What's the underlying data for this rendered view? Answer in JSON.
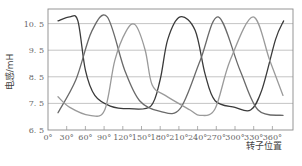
{
  "chart_data": {
    "type": "line",
    "title": "",
    "xlabel": "转子位置",
    "ylabel": "电感/mH",
    "xlim": [
      0,
      360
    ],
    "ylim": [
      6.5,
      10.9
    ],
    "x_ticks": [
      "0°",
      "30°",
      "60°",
      "90°",
      "120°",
      "150°",
      "180°",
      "210°",
      "240°",
      "270°",
      "300°",
      "330°",
      "360°"
    ],
    "y_ticks": [
      "10.5",
      "9.5",
      "8.5",
      "7.5",
      "6.5"
    ],
    "y_tick_values": [
      10.5,
      9.5,
      8.5,
      7.5,
      6.5
    ],
    "grid": "horizontal",
    "legend": "none",
    "series": [
      {
        "name": "phase-1",
        "color": "#3a3a3a",
        "x": [
          16,
          35,
          48,
          60,
          75,
          100,
          130,
          165,
          180,
          192,
          212,
          236,
          252,
          268,
          300,
          325,
          343,
          365,
          378
        ],
        "y": [
          10.6,
          10.75,
          10.6,
          8.75,
          7.8,
          7.4,
          7.3,
          7.4,
          8.4,
          9.9,
          10.75,
          10.25,
          8.6,
          7.6,
          7.35,
          7.25,
          8.0,
          9.9,
          10.6
        ]
      },
      {
        "name": "phase-2",
        "color": "#6a6a6a",
        "x": [
          16,
          45,
          70,
          95,
          123,
          147,
          180,
          212,
          244,
          273,
          308,
          337,
          377
        ],
        "y": [
          7.15,
          8.4,
          10.2,
          10.75,
          8.75,
          7.6,
          7.2,
          7.3,
          9.1,
          10.75,
          8.75,
          7.25,
          7.05
        ]
      },
      {
        "name": "phase-3",
        "color": "#9a9a9a",
        "x": [
          16,
          35,
          67,
          91,
          107,
          125,
          140,
          156,
          167,
          188,
          228,
          244,
          268,
          292,
          329,
          356,
          377
        ],
        "y": [
          7.75,
          7.35,
          7.05,
          7.25,
          9.1,
          10.2,
          10.45,
          9.5,
          8.2,
          7.8,
          7.25,
          7.05,
          7.3,
          9.1,
          10.75,
          9.1,
          7.8
        ]
      }
    ]
  }
}
